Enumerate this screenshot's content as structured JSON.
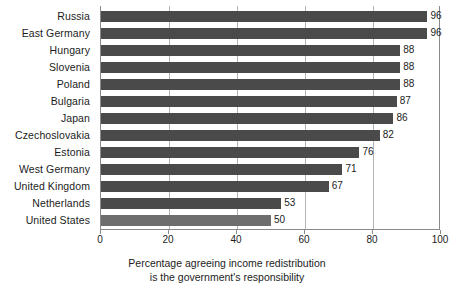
{
  "chart_data": {
    "type": "bar",
    "orientation": "horizontal",
    "title": "",
    "subtitle": "",
    "xlabel": "Percentage agreeing income redistribution is the government's responsibility",
    "ylabel": "",
    "xlim": [
      0,
      100
    ],
    "xticks": [
      0,
      20,
      40,
      60,
      80,
      100
    ],
    "xtick_labels": [
      "0",
      "20",
      "40",
      "60",
      "80",
      "100"
    ],
    "grid": true,
    "grid_axis": "x",
    "legend": false,
    "categories": [
      "Russia",
      "East Germany",
      "Hungary",
      "Slovenia",
      "Poland",
      "Bulgaria",
      "Japan",
      "Czechoslovakia",
      "Estonia",
      "West Germany",
      "United Kingdom",
      "Netherlands",
      "United States"
    ],
    "values": [
      96,
      96,
      88,
      88,
      88,
      87,
      86,
      82,
      76,
      71,
      67,
      53,
      50
    ],
    "value_labels": [
      "96",
      "96",
      "88",
      "88",
      "88",
      "87",
      "86",
      "82",
      "76",
      "71",
      "67",
      "53",
      "50"
    ],
    "highlight_category": "United States",
    "colors": {
      "bar": "#4a4a4a",
      "bar_highlight": "#6e6e6e",
      "gridline": "#b4b4b4",
      "axis": "#8a8a8a",
      "text": "#1c1c1c",
      "background": "#ffffff"
    }
  },
  "caption": {
    "line1": "Percentage agreeing income redistribution",
    "line2": "is the government's responsibility"
  }
}
